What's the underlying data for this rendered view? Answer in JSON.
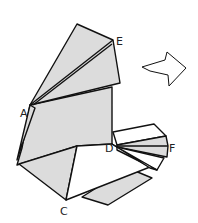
{
  "diagram": {
    "type": "origami-folding-step",
    "labels": {
      "A": "A",
      "C": "C",
      "D": "D",
      "E": "E",
      "F": "F"
    },
    "arrow": "turn-over-arrow",
    "colors": {
      "paper_shaded": "#dcdcdc",
      "paper_white": "#ffffff",
      "line": "#111111"
    }
  }
}
